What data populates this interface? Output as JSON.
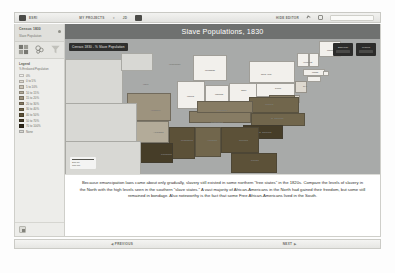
{
  "toolbar": {
    "brand_label": "ESRI",
    "projects_label": "MY PROJECTS",
    "account_label": "JD",
    "hide_editor_label": "HIDE EDITOR",
    "share_icon": "share-icon",
    "fullscreen_icon": "fullscreen-icon",
    "caret_glyph": "▾"
  },
  "sidebar": {
    "title": "Census 1830",
    "subtitle": "Slave Population",
    "menu_dot": "options-dot",
    "tools": [
      {
        "name": "layers-icon"
      },
      {
        "name": "symbology-icon"
      },
      {
        "name": "filter-icon"
      }
    ],
    "legend": {
      "title": "Legend",
      "subtitle": "% Enslaved Population",
      "items": [
        {
          "label": "0%",
          "color": "#f2f0ec"
        },
        {
          "label": "0 to 5%",
          "color": "#ded9d0"
        },
        {
          "label": "5 to 10%",
          "color": "#c9c2b4"
        },
        {
          "label": "10 to 15%",
          "color": "#b3ab99"
        },
        {
          "label": "15 to 20%",
          "color": "#9d937e"
        },
        {
          "label": "20 to 30%",
          "color": "#877c64"
        },
        {
          "label": "30 to 40%",
          "color": "#71664c"
        },
        {
          "label": "40 to 50%",
          "color": "#5c5138"
        },
        {
          "label": "50 to 70%",
          "color": "#463d28"
        },
        {
          "label": "70 to 100%",
          "color": "#30291a"
        },
        {
          "label": "None",
          "color": "#d8d8d4"
        }
      ]
    },
    "footer_button": "add-layer-button"
  },
  "map": {
    "banner_title": "Slave Populations, 1830",
    "chip_label": "Census 1830 - % Slave Population",
    "controls": [
      {
        "label": "Basemap",
        "name": "basemap-button"
      },
      {
        "label": "Legend",
        "name": "legend-button"
      }
    ],
    "scale": {
      "miles": "200 mi",
      "kilometers": "300 km"
    },
    "state_labels": [
      {
        "text": "Maine",
        "x": 262,
        "y": 10
      },
      {
        "text": "Vermont",
        "x": 238,
        "y": 22
      },
      {
        "text": "New York",
        "x": 196,
        "y": 34
      },
      {
        "text": "Mass.",
        "x": 247,
        "y": 32
      },
      {
        "text": "Michigan",
        "x": 140,
        "y": 30
      },
      {
        "text": "Wisconsin",
        "x": 104,
        "y": 24
      },
      {
        "text": "Iowa",
        "x": 78,
        "y": 44
      },
      {
        "text": "Illinois",
        "x": 122,
        "y": 56
      },
      {
        "text": "Indiana",
        "x": 150,
        "y": 54
      },
      {
        "text": "Ohio",
        "x": 176,
        "y": 50
      },
      {
        "text": "Penn.",
        "x": 210,
        "y": 48
      },
      {
        "text": "N.J.",
        "x": 238,
        "y": 46
      },
      {
        "text": "Missouri",
        "x": 86,
        "y": 70
      },
      {
        "text": "Kentucky",
        "x": 152,
        "y": 70
      },
      {
        "text": "Virginia",
        "x": 200,
        "y": 64
      },
      {
        "text": "Tennessee",
        "x": 146,
        "y": 82
      },
      {
        "text": "N. Carolina",
        "x": 206,
        "y": 78
      },
      {
        "text": "Arkansas",
        "x": 88,
        "y": 92
      },
      {
        "text": "S. Carolina",
        "x": 194,
        "y": 92
      },
      {
        "text": "Alabama",
        "x": 142,
        "y": 100
      },
      {
        "text": "Georgia",
        "x": 174,
        "y": 100
      },
      {
        "text": "Mississippi",
        "x": 116,
        "y": 100
      },
      {
        "text": "Louisiana",
        "x": 96,
        "y": 114
      },
      {
        "text": "Florida",
        "x": 186,
        "y": 120
      }
    ]
  },
  "caption": {
    "text": "Because emancipation laws came about only gradually, slavery still existed in some northern \"free states\" in the 1820s.  Compare the levels of slavery in the North with the high levels seen in the southern \"slave states.\"  A vast majority of African-Americans in the North had gained their freedom, but some still remained in bondage.  Also noteworthy is the fact that some Free African-Americans lived in the South."
  },
  "navigation": {
    "previous_label": "Previous",
    "next_label": "Next",
    "prev_arrow": "◀",
    "next_arrow": "▶"
  },
  "chart_data": {
    "type": "heatmap",
    "title": "Slave Populations, 1830",
    "subtitle": "Census 1830 - % Slave Population",
    "xlabel": "",
    "ylabel": "",
    "legend_position": "left-sidebar",
    "grid": false,
    "categories": [
      "Maine",
      "Vermont",
      "New Hampshire",
      "Massachusetts",
      "Rhode Island",
      "Connecticut",
      "New York",
      "New Jersey",
      "Pennsylvania",
      "Ohio",
      "Indiana",
      "Illinois",
      "Michigan",
      "Delaware",
      "Maryland",
      "Virginia",
      "North Carolina",
      "South Carolina",
      "Georgia",
      "Florida",
      "Alabama",
      "Mississippi",
      "Louisiana",
      "Arkansas",
      "Tennessee",
      "Kentucky",
      "Missouri"
    ],
    "values": [
      0,
      0,
      0,
      0,
      0,
      0,
      0,
      3,
      0,
      0,
      0,
      0,
      0,
      4,
      23,
      39,
      33,
      54,
      42,
      47,
      38,
      48,
      51,
      15,
      21,
      24,
      18
    ],
    "value_unit": "percent enslaved",
    "bins": [
      {
        "label": "0%",
        "min": 0,
        "max": 0,
        "color": "#f2f0ec"
      },
      {
        "label": "0 to 5%",
        "min": 0,
        "max": 5,
        "color": "#ded9d0"
      },
      {
        "label": "5 to 10%",
        "min": 5,
        "max": 10,
        "color": "#c9c2b4"
      },
      {
        "label": "10 to 15%",
        "min": 10,
        "max": 15,
        "color": "#b3ab99"
      },
      {
        "label": "15 to 20%",
        "min": 15,
        "max": 20,
        "color": "#9d937e"
      },
      {
        "label": "20 to 30%",
        "min": 20,
        "max": 30,
        "color": "#877c64"
      },
      {
        "label": "30 to 40%",
        "min": 30,
        "max": 40,
        "color": "#71664c"
      },
      {
        "label": "40 to 50%",
        "min": 40,
        "max": 50,
        "color": "#5c5138"
      },
      {
        "label": "50 to 70%",
        "min": 50,
        "max": 70,
        "color": "#463d28"
      },
      {
        "label": "70 to 100%",
        "min": 70,
        "max": 100,
        "color": "#30291a"
      }
    ]
  }
}
